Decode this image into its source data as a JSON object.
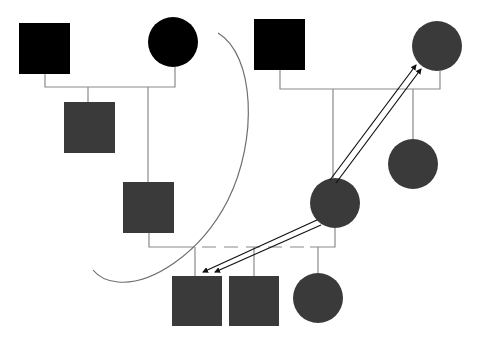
{
  "diagram": {
    "type": "pedigree",
    "colors": {
      "affected_black": "#000000",
      "affected_gray": "#3a3a3a",
      "line": "#8a8a8a",
      "curve": "#6e6e6e",
      "arrow": "#111111",
      "background": "#ffffff"
    },
    "individuals": [
      {
        "id": "I-1",
        "sex": "male",
        "shade": "black",
        "generation": 1
      },
      {
        "id": "I-2",
        "sex": "female",
        "shade": "black",
        "generation": 1
      },
      {
        "id": "I-3",
        "sex": "male",
        "shade": "black",
        "generation": 1
      },
      {
        "id": "I-4",
        "sex": "female",
        "shade": "gray",
        "generation": 1
      },
      {
        "id": "II-1",
        "sex": "male",
        "shade": "gray",
        "generation": 2
      },
      {
        "id": "II-2",
        "sex": "male",
        "shade": "gray",
        "generation": 2
      },
      {
        "id": "II-3",
        "sex": "female",
        "shade": "gray",
        "generation": 2
      },
      {
        "id": "II-4",
        "sex": "female",
        "shade": "gray",
        "generation": 2
      },
      {
        "id": "III-1",
        "sex": "male",
        "shade": "gray",
        "generation": 3
      },
      {
        "id": "III-2",
        "sex": "male",
        "shade": "gray",
        "generation": 3
      },
      {
        "id": "III-3",
        "sex": "female",
        "shade": "gray",
        "generation": 3
      }
    ],
    "relationships": [
      {
        "type": "mating",
        "partners": [
          "I-1",
          "I-2"
        ],
        "children": [
          "II-1",
          "II-2"
        ]
      },
      {
        "type": "mating",
        "partners": [
          "I-3",
          "I-4"
        ],
        "children": [
          "II-3",
          "II-4"
        ]
      },
      {
        "type": "mating",
        "style": "dashed",
        "partners": [
          "II-2",
          "II-3"
        ],
        "children": [
          "III-1",
          "III-2",
          "III-3"
        ]
      }
    ],
    "arrows": [
      {
        "from": "II-3",
        "to": "I-4",
        "style": "double-line"
      },
      {
        "from": "II-3",
        "to": "III-1",
        "style": "double-line"
      }
    ],
    "annotations": [
      {
        "type": "curve",
        "description": "curved boundary line separating left lineage"
      }
    ]
  }
}
